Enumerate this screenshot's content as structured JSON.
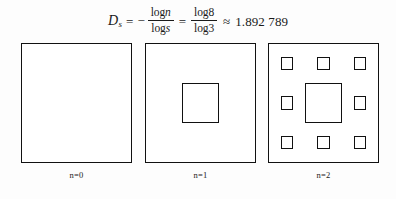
{
  "formula": {
    "lhs_symbol": "D",
    "lhs_subscript": "s",
    "eq1": "=",
    "minus": "−",
    "frac1_num_log": "log",
    "frac1_num_var": "n",
    "frac1_den_log": "log",
    "frac1_den_var": "s",
    "eq2": "=",
    "frac2_num": "log8",
    "frac2_den": "log3",
    "approx": "≈",
    "result": "1.892 789"
  },
  "figures": [
    {
      "label": "n=0",
      "iteration": 0,
      "holes": []
    },
    {
      "label": "n=1",
      "iteration": 1,
      "holes": [
        {
          "kind": "center"
        }
      ]
    },
    {
      "label": "n=2",
      "iteration": 2,
      "holes": [
        {
          "kind": "center"
        },
        {
          "kind": "small",
          "left": 11.11,
          "top": 11.11
        },
        {
          "kind": "small",
          "left": 44.44,
          "top": 11.11
        },
        {
          "kind": "small",
          "left": 77.78,
          "top": 11.11
        },
        {
          "kind": "small",
          "left": 11.11,
          "top": 44.44
        },
        {
          "kind": "small",
          "left": 77.78,
          "top": 44.44
        },
        {
          "kind": "small",
          "left": 11.11,
          "top": 77.78
        },
        {
          "kind": "small",
          "left": 44.44,
          "top": 77.78
        },
        {
          "kind": "small",
          "left": 77.78,
          "top": 77.78
        }
      ]
    }
  ],
  "colors": {
    "background": "#fdfdfd",
    "ink": "#111111",
    "square_fill": "#ffffff"
  }
}
